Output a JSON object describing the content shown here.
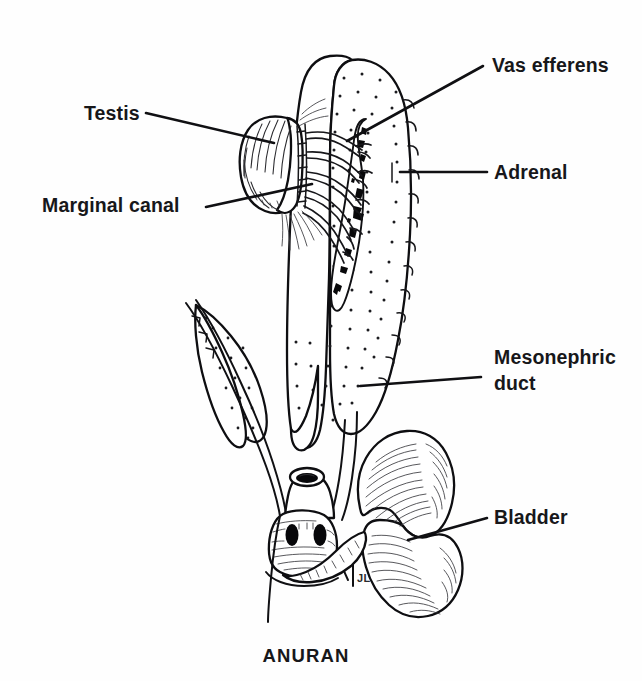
{
  "figure": {
    "caption": "ANURAN",
    "artist_signature": "JL",
    "background_color": "#fefefe",
    "ink_color": "#101013"
  },
  "labels": [
    {
      "id": "vas-efferens",
      "text": "Vas efferens",
      "text_x": 492,
      "text_y": 72,
      "leader": {
        "x1": 483,
        "y1": 66,
        "x2": 347,
        "y2": 141
      }
    },
    {
      "id": "testis",
      "text": "Testis",
      "text_x": 84,
      "text_y": 120,
      "leader": {
        "x1": 146,
        "y1": 113,
        "x2": 274,
        "y2": 143
      }
    },
    {
      "id": "adrenal",
      "text": "Adrenal",
      "text_x": 494,
      "text_y": 179,
      "leader": {
        "x1": 487,
        "y1": 172,
        "x2": 400,
        "y2": 172
      }
    },
    {
      "id": "marginal-canal",
      "text": "Marginal canal",
      "text_x": 42,
      "text_y": 212,
      "leader": {
        "x1": 206,
        "y1": 207,
        "x2": 312,
        "y2": 184
      }
    },
    {
      "id": "mesonephric-duct",
      "text": "Mesonephric",
      "text_line2": "duct",
      "text_x": 494,
      "text_y": 364,
      "text_line2_y": 390,
      "leader": {
        "x1": 481,
        "y1": 377,
        "x2": 360,
        "y2": 386
      }
    },
    {
      "id": "bladder",
      "text": "Bladder",
      "text_x": 494,
      "text_y": 524,
      "leader": {
        "x1": 487,
        "y1": 518,
        "x2": 408,
        "y2": 540
      }
    }
  ],
  "structures": [
    {
      "id": "testis",
      "name": "Testis",
      "description": "oval hatched gonad on left"
    },
    {
      "id": "marginal-canal",
      "name": "Marginal canal",
      "description": "ladder-like canal between testis and kidney"
    },
    {
      "id": "vas-efferens",
      "name": "Vas efferens",
      "description": "efferent ductules crossing to kidney"
    },
    {
      "id": "kidney",
      "name": "Mesonephros",
      "description": "stippled elongate kidney"
    },
    {
      "id": "adrenal",
      "name": "Adrenal",
      "description": "dark irregular strip on kidney face"
    },
    {
      "id": "mesonephric-duct",
      "name": "Mesonephric duct",
      "description": "duct running along kidney to cloaca"
    },
    {
      "id": "cloaca",
      "name": "Cloaca",
      "description": "hatched chamber with paired dark openings"
    },
    {
      "id": "bladder",
      "name": "Bladder",
      "description": "bilobed hatched urinary bladder"
    }
  ]
}
